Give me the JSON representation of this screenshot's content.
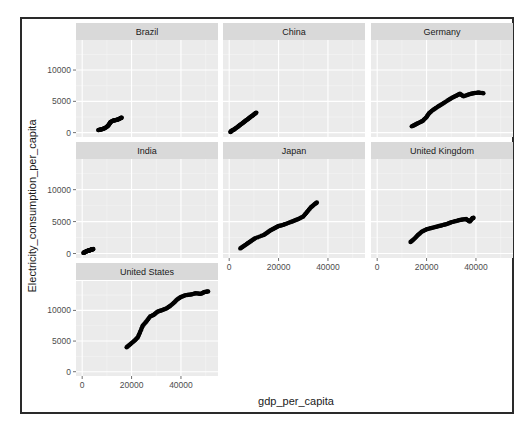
{
  "chart_data": {
    "type": "scatter",
    "title": "",
    "xlabel": "gdp_per_capita",
    "ylabel": "Electricity_consumption_per_capita",
    "layout": "facet_wrap, 3 columns, fixed scales",
    "xlim": [
      -2500,
      55000
    ],
    "ylim": [
      -700,
      14800
    ],
    "x_ticks": [
      0,
      20000,
      40000
    ],
    "x_tick_labels": [
      "0",
      "20000",
      "40000"
    ],
    "y_ticks": [
      0,
      5000,
      10000
    ],
    "y_tick_labels": [
      "0",
      "5000",
      "10000"
    ],
    "grid": true,
    "legend": "none",
    "panel_background": "#ebebeb",
    "strip_background": "#d9d9d9",
    "point_color": "#000000",
    "facets": [
      {
        "name": "Brazil",
        "points": [
          [
            6500,
            400
          ],
          [
            7500,
            500
          ],
          [
            8500,
            600
          ],
          [
            9500,
            800
          ],
          [
            10500,
            1100
          ],
          [
            11000,
            1400
          ],
          [
            11500,
            1700
          ],
          [
            12500,
            1900
          ],
          [
            13500,
            2000
          ],
          [
            14500,
            2100
          ],
          [
            15500,
            2300
          ],
          [
            16000,
            2400
          ]
        ]
      },
      {
        "name": "China",
        "points": [
          [
            500,
            100
          ],
          [
            1000,
            300
          ],
          [
            2000,
            500
          ],
          [
            3000,
            800
          ],
          [
            4000,
            1100
          ],
          [
            5000,
            1400
          ],
          [
            6000,
            1700
          ],
          [
            7000,
            2000
          ],
          [
            8000,
            2300
          ],
          [
            9000,
            2600
          ],
          [
            10000,
            2900
          ],
          [
            11000,
            3200
          ]
        ]
      },
      {
        "name": "Germany",
        "points": [
          [
            14000,
            1000
          ],
          [
            15500,
            1300
          ],
          [
            17000,
            1600
          ],
          [
            18500,
            1900
          ],
          [
            20000,
            2500
          ],
          [
            21000,
            3100
          ],
          [
            22500,
            3600
          ],
          [
            24000,
            4000
          ],
          [
            26000,
            4500
          ],
          [
            28000,
            5000
          ],
          [
            30000,
            5500
          ],
          [
            32000,
            5900
          ],
          [
            33500,
            6200
          ],
          [
            35000,
            5800
          ],
          [
            37000,
            6100
          ],
          [
            39000,
            6300
          ],
          [
            41000,
            6400
          ],
          [
            43000,
            6300
          ]
        ]
      },
      {
        "name": "India",
        "points": [
          [
            500,
            100
          ],
          [
            1000,
            200
          ],
          [
            1500,
            300
          ],
          [
            2000,
            400
          ],
          [
            2500,
            450
          ],
          [
            3000,
            500
          ],
          [
            3500,
            600
          ],
          [
            4000,
            650
          ],
          [
            4500,
            700
          ]
        ]
      },
      {
        "name": "Japan",
        "points": [
          [
            4500,
            800
          ],
          [
            6000,
            1200
          ],
          [
            7500,
            1600
          ],
          [
            9000,
            2000
          ],
          [
            10500,
            2400
          ],
          [
            14000,
            2900
          ],
          [
            15500,
            3300
          ],
          [
            17000,
            3700
          ],
          [
            18500,
            4000
          ],
          [
            20000,
            4300
          ],
          [
            22000,
            4500
          ],
          [
            24000,
            4800
          ],
          [
            26000,
            5100
          ],
          [
            28000,
            5400
          ],
          [
            30000,
            5800
          ],
          [
            31500,
            6500
          ],
          [
            33000,
            7200
          ],
          [
            34500,
            7700
          ],
          [
            35500,
            8000
          ]
        ]
      },
      {
        "name": "United Kingdom",
        "points": [
          [
            13500,
            1800
          ],
          [
            15000,
            2300
          ],
          [
            16500,
            2900
          ],
          [
            18000,
            3400
          ],
          [
            20000,
            3800
          ],
          [
            22000,
            4000
          ],
          [
            24000,
            4200
          ],
          [
            26000,
            4400
          ],
          [
            28000,
            4600
          ],
          [
            30000,
            4900
          ],
          [
            32000,
            5100
          ],
          [
            34000,
            5300
          ],
          [
            36000,
            5400
          ],
          [
            37500,
            5000
          ],
          [
            38500,
            5500
          ],
          [
            39000,
            5600
          ]
        ]
      },
      {
        "name": "United States",
        "points": [
          [
            18000,
            4000
          ],
          [
            19500,
            4500
          ],
          [
            21000,
            5000
          ],
          [
            22500,
            5600
          ],
          [
            23500,
            6500
          ],
          [
            24500,
            7500
          ],
          [
            26000,
            8200
          ],
          [
            27500,
            9000
          ],
          [
            29000,
            9300
          ],
          [
            30500,
            9800
          ],
          [
            32000,
            10000
          ],
          [
            34000,
            10300
          ],
          [
            35500,
            10700
          ],
          [
            37000,
            11200
          ],
          [
            38500,
            11800
          ],
          [
            40000,
            12200
          ],
          [
            42000,
            12500
          ],
          [
            44000,
            12600
          ],
          [
            46000,
            12800
          ],
          [
            48000,
            12700
          ],
          [
            49500,
            13000
          ],
          [
            51000,
            13100
          ]
        ]
      }
    ]
  }
}
